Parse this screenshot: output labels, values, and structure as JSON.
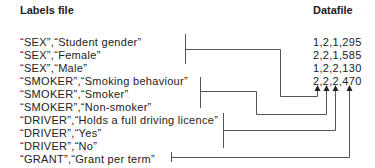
{
  "headers": {
    "labels": "Labels file",
    "data": "Datafile"
  },
  "labels": [
    "“SEX”,“Student gender”",
    "“SEX”,“Female”",
    "“SEX”,“Male”",
    "“SMOKER”,“Smoking behaviour”",
    "“SMOKER”,“Smoker”",
    "“SMOKER”,“Non-smoker”",
    "“DRIVER”,“Holds a full driving licence”",
    "“DRIVER”,“Yes”",
    "“DRIVER”,“No”",
    "“GRANT”,“Grant per term”"
  ],
  "datafile": [
    "1,2,1,295",
    "2,2,1,585",
    "1,2,2,130",
    "2,2,2,470"
  ],
  "colors": {
    "line": "#555555",
    "text": "#222222"
  }
}
